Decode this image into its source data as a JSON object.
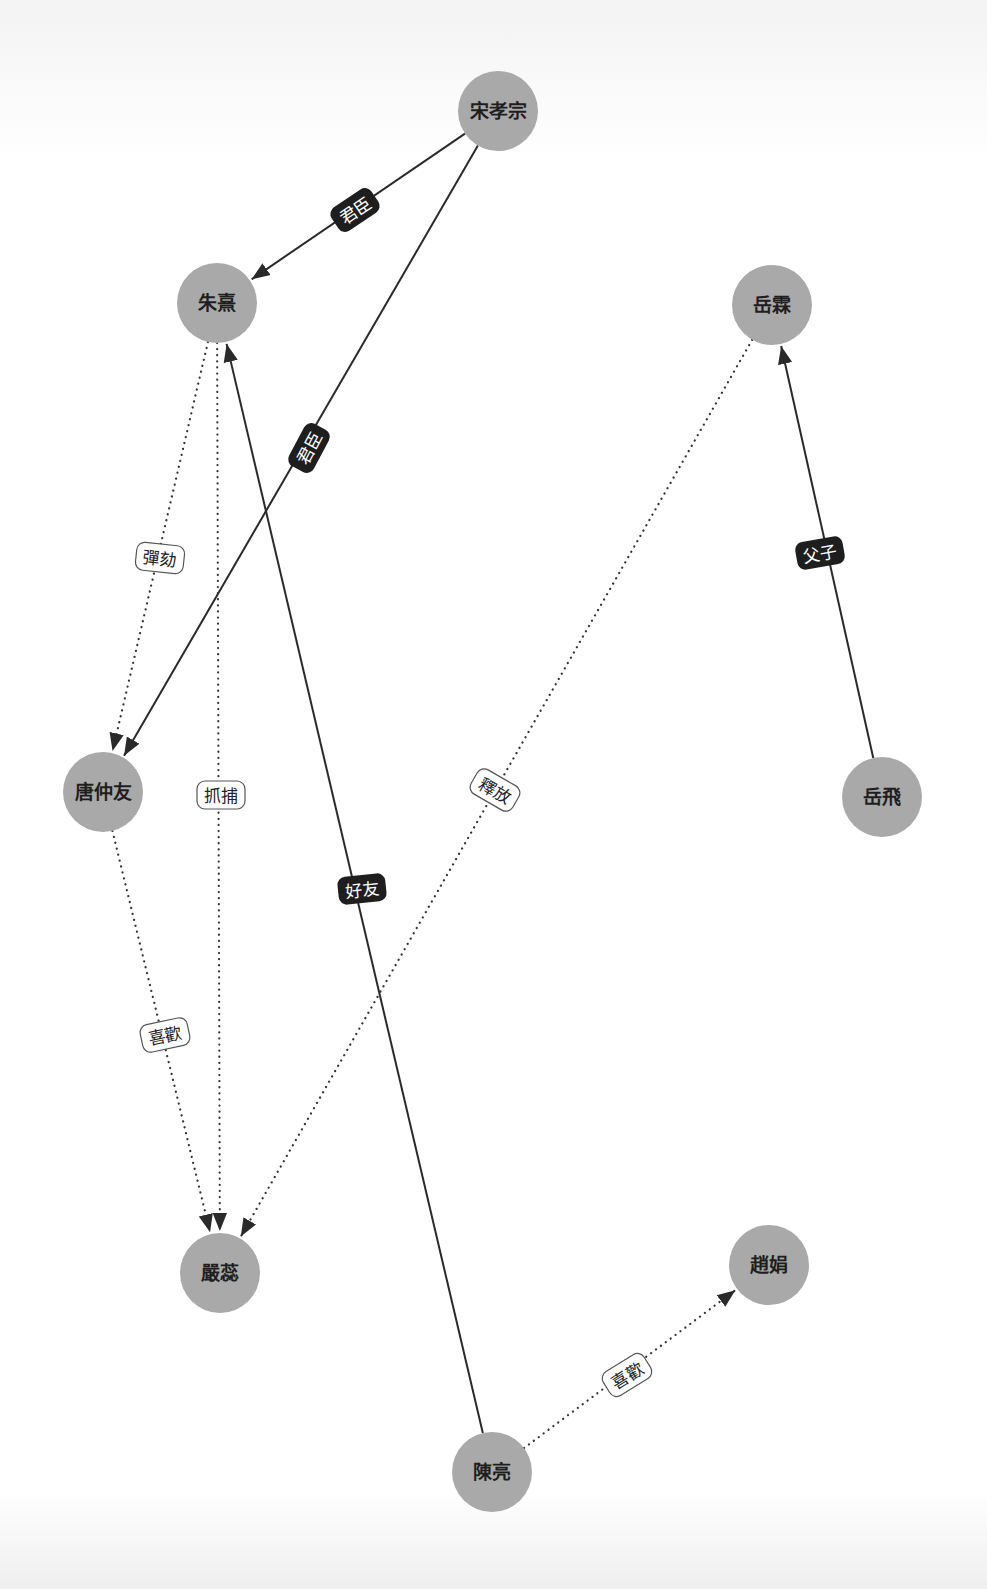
{
  "diagram": {
    "type": "directed-graph",
    "colors": {
      "node_fill": "#a9a9a9",
      "node_text": "#1e1e1e",
      "edge": "#2a2a2a",
      "label_dark_bg": "#1e1e1e",
      "label_light_bg": "#ffffff"
    },
    "nodes": [
      {
        "id": "songxiaozong",
        "label": "宋孝宗",
        "x": 498,
        "y": 111
      },
      {
        "id": "zhuxi",
        "label": "朱熹",
        "x": 217,
        "y": 303
      },
      {
        "id": "yuelin",
        "label": "岳霖",
        "x": 772,
        "y": 305
      },
      {
        "id": "tangzhongyou",
        "label": "唐仲友",
        "x": 103,
        "y": 792
      },
      {
        "id": "yuefei",
        "label": "岳飛",
        "x": 882,
        "y": 797
      },
      {
        "id": "yanrui",
        "label": "嚴蕊",
        "x": 220,
        "y": 1273
      },
      {
        "id": "zhaojuan",
        "label": "趙娟",
        "x": 769,
        "y": 1265
      },
      {
        "id": "chenliang",
        "label": "陳亮",
        "x": 492,
        "y": 1472
      }
    ],
    "edges": [
      {
        "from": "songxiaozong",
        "to": "zhuxi",
        "label": "君臣",
        "style": "solid",
        "label_style": "dark",
        "lx": 355,
        "ly": 210,
        "angle": -34
      },
      {
        "from": "songxiaozong",
        "to": "tangzhongyou",
        "label": "君臣",
        "style": "solid",
        "label_style": "dark",
        "lx": 309,
        "ly": 448,
        "angle": -62
      },
      {
        "from": "zhuxi",
        "to": "tangzhongyou",
        "label": "彈劾",
        "style": "dotted",
        "label_style": "light",
        "lx": 160,
        "ly": 558,
        "angle": 6
      },
      {
        "from": "zhuxi",
        "to": "yanrui",
        "label": "抓捕",
        "style": "dotted",
        "label_style": "light",
        "lx": 221,
        "ly": 795,
        "angle": 0
      },
      {
        "from": "chenliang",
        "to": "zhuxi",
        "label": "好友",
        "style": "solid",
        "label_style": "dark",
        "lx": 362,
        "ly": 889,
        "angle": -6
      },
      {
        "from": "yuefei",
        "to": "yuelin",
        "label": "父子",
        "style": "solid",
        "label_style": "dark",
        "lx": 820,
        "ly": 553,
        "angle": -10
      },
      {
        "from": "yuelin",
        "to": "yanrui",
        "label": "釋放",
        "style": "dotted",
        "label_style": "light",
        "lx": 495,
        "ly": 790,
        "angle": 30
      },
      {
        "from": "tangzhongyou",
        "to": "yanrui",
        "label": "喜歡",
        "style": "dotted",
        "label_style": "light",
        "lx": 165,
        "ly": 1035,
        "angle": -12
      },
      {
        "from": "chenliang",
        "to": "zhaojuan",
        "label": "喜歡",
        "style": "dotted",
        "label_style": "light",
        "lx": 627,
        "ly": 1375,
        "angle": -32
      }
    ]
  }
}
